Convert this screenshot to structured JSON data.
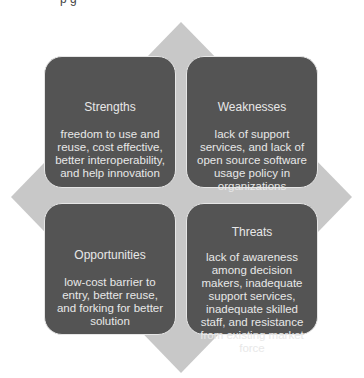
{
  "caption_fragment": "p    g",
  "diagram": {
    "type": "SWOT",
    "background_shape": "diamond",
    "colors": {
      "box_fill": "#545454",
      "diamond_fill": "#c8c8c8",
      "text": "#e8e8e8",
      "border": "#e6e6e6"
    },
    "quadrants": [
      {
        "title": "Strengths",
        "body": "freedom to use and reuse, cost effective, better interoperability, and help innovation"
      },
      {
        "title": "Weaknesses",
        "body": "lack of support services, and lack of open source software usage policy in organizations"
      },
      {
        "title": "Opportunities",
        "body": "low-cost barrier to entry, better reuse, and forking for better solution"
      },
      {
        "title": "Threats",
        "body": "lack of awareness among decision makers, inadequate support services, inadequate skilled staff, and resistance from existing market force"
      }
    ]
  }
}
